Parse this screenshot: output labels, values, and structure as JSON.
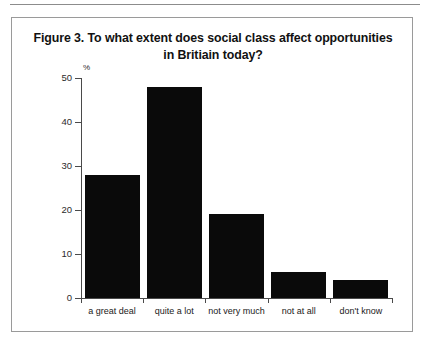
{
  "figure": {
    "title": "Figure 3. To what extent does social class affect opportunities in Britiain today?",
    "title_line1": "Figure 3. To what extent does social class affect opportunities",
    "title_line2": "in Britiain today?",
    "border_color": "#9a9a9a",
    "rule_color": "#8c8c8c"
  },
  "chart_data": {
    "type": "bar",
    "title": "Figure 3. To what extent does social class affect opportunities in Britiain today?",
    "categories": [
      "a great deal",
      "quite a lot",
      "not very much",
      "not at all",
      "don't know"
    ],
    "values": [
      28,
      48,
      19,
      6,
      4
    ],
    "xlabel": "",
    "ylabel": "%",
    "ylim": [
      0,
      50
    ],
    "yticks": [
      0,
      10,
      20,
      30,
      40,
      50
    ],
    "ytick_labels": [
      "0",
      "10",
      "20",
      "30",
      "40",
      "50"
    ],
    "unit_symbol": "%",
    "grid": false,
    "legend": false,
    "bar_color": "#0a0a0a",
    "axis_color": "#4a4a4a"
  }
}
